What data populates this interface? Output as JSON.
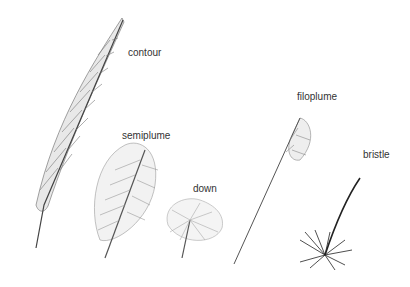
{
  "diagram": {
    "labels": {
      "contour": "contour",
      "semiplume": "semiplume",
      "down": "down",
      "filoplume": "filoplume",
      "bristle": "bristle"
    },
    "colors": {
      "background": "#ffffff",
      "ink": "#333333",
      "sketch": "#8a8a8a"
    }
  }
}
